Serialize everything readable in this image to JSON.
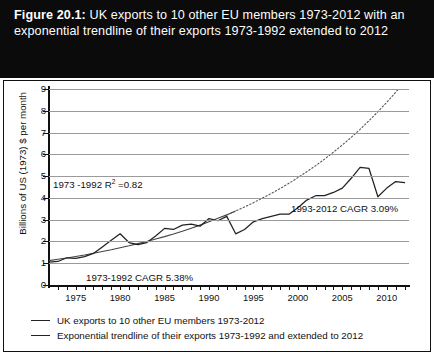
{
  "title": {
    "figure_number": "Figure 20.1:",
    "text": " UK exports to 10 other EU members 1973-2012 with an exponential trendline of their exports 1973-1992 extended to 2012"
  },
  "legend": {
    "items": [
      {
        "label": "UK exports to 10 other EU members 1973-2012",
        "style": "solid",
        "color": "#222222"
      },
      {
        "label": "Exponential trendline of their exports 1973-1992 and extended to 2012",
        "style": "solid",
        "color": "#222222"
      }
    ]
  },
  "annotations": {
    "r2": {
      "pre": "1973 -1992 R",
      "sup": "2",
      "post": " =0.82"
    },
    "cagr_early": "1973-1992 CAGR 5.38%",
    "cagr_late": "1993-2012 CAGR 3.09%"
  },
  "colors": {
    "banner_background": "#0b0b0b",
    "banner_text": "#ffffff",
    "series_line": "#222222",
    "trendline": "#444444",
    "gridline": "#9a9a9a",
    "axis": "#111111",
    "plot_background": "#ffffff"
  },
  "chart_data": {
    "type": "line",
    "title": "UK exports to 10 other EU members 1973-2012 with an exponential trendline of their exports 1973-1992 extended to 2012",
    "xlabel": "",
    "ylabel": "Billions of US (1973) $ per month",
    "xlim": [
      1972,
      2012.5
    ],
    "ylim": [
      0,
      9
    ],
    "ytick_values": [
      0,
      1,
      2,
      3,
      4,
      5,
      6,
      7,
      8,
      9
    ],
    "xtick_labels": [
      "1975",
      "1980",
      "1985",
      "1990",
      "1995",
      "2000",
      "2005",
      "2010"
    ],
    "xtick_label_values": [
      1975,
      1980,
      1985,
      1990,
      1995,
      2000,
      2005,
      2010
    ],
    "xtick_minor_values": [
      1973,
      1974,
      1975,
      1976,
      1977,
      1978,
      1979,
      1980,
      1981,
      1982,
      1983,
      1984,
      1985,
      1986,
      1987,
      1988,
      1989,
      1990,
      1991,
      1992,
      1993,
      1994,
      1995,
      1996,
      1997,
      1998,
      1999,
      2000,
      2001,
      2002,
      2003,
      2004,
      2005,
      2006,
      2007,
      2008,
      2009,
      2010,
      2011,
      2012
    ],
    "grid": "horizontal",
    "legend_position": "bottom-left",
    "x": [
      1972,
      1973,
      1974,
      1975,
      1976,
      1977,
      1978,
      1979,
      1980,
      1981,
      1982,
      1983,
      1984,
      1985,
      1986,
      1987,
      1988,
      1989,
      1990,
      1991,
      1992,
      1993,
      1994,
      1995,
      1996,
      1997,
      1998,
      1999,
      2000,
      2001,
      2002,
      2003,
      2004,
      2005,
      2006,
      2007,
      2008,
      2009,
      2010,
      2011,
      2012
    ],
    "series": [
      {
        "name": "UK exports to 10 other EU members 1973-2012",
        "style": "solid",
        "values": [
          1.05,
          1.08,
          1.25,
          1.22,
          1.3,
          1.45,
          1.75,
          2.05,
          2.35,
          1.95,
          1.85,
          1.95,
          2.25,
          2.6,
          2.55,
          2.75,
          2.8,
          2.7,
          3.05,
          2.95,
          3.15,
          2.35,
          2.55,
          2.9,
          3.05,
          3.15,
          3.25,
          3.25,
          3.55,
          3.9,
          4.1,
          4.1,
          4.25,
          4.45,
          4.9,
          5.4,
          5.35,
          4.05,
          4.45,
          4.75,
          4.7
        ]
      },
      {
        "name": "Exponential trendline of their exports 1973-1992 and extended to 2012",
        "style": "dotted-extension",
        "fit_range": [
          1973,
          1992
        ],
        "extended_to": 2012,
        "r_squared": 0.82,
        "values": [
          1.12,
          1.18,
          1.24,
          1.31,
          1.38,
          1.46,
          1.54,
          1.62,
          1.71,
          1.8,
          1.9,
          2.0,
          2.11,
          2.22,
          2.34,
          2.47,
          2.61,
          2.75,
          2.9,
          3.06,
          3.22,
          3.4,
          3.58,
          3.78,
          3.99,
          4.2,
          4.43,
          4.67,
          4.93,
          5.2,
          5.48,
          5.78,
          6.1,
          6.43,
          6.78,
          7.15,
          7.54,
          7.96,
          8.39,
          8.85,
          9.33
        ]
      }
    ],
    "annotations": [
      {
        "text": "1973 -1992 R2 =0.82",
        "x": 1974.5,
        "y": 4.5
      },
      {
        "text": "1973-1992 CAGR 5.38%",
        "x": 1978.5,
        "y": 0.6
      },
      {
        "text": "1993-2012 CAGR 3.09%",
        "x": 2000.5,
        "y": 3.85
      }
    ]
  }
}
